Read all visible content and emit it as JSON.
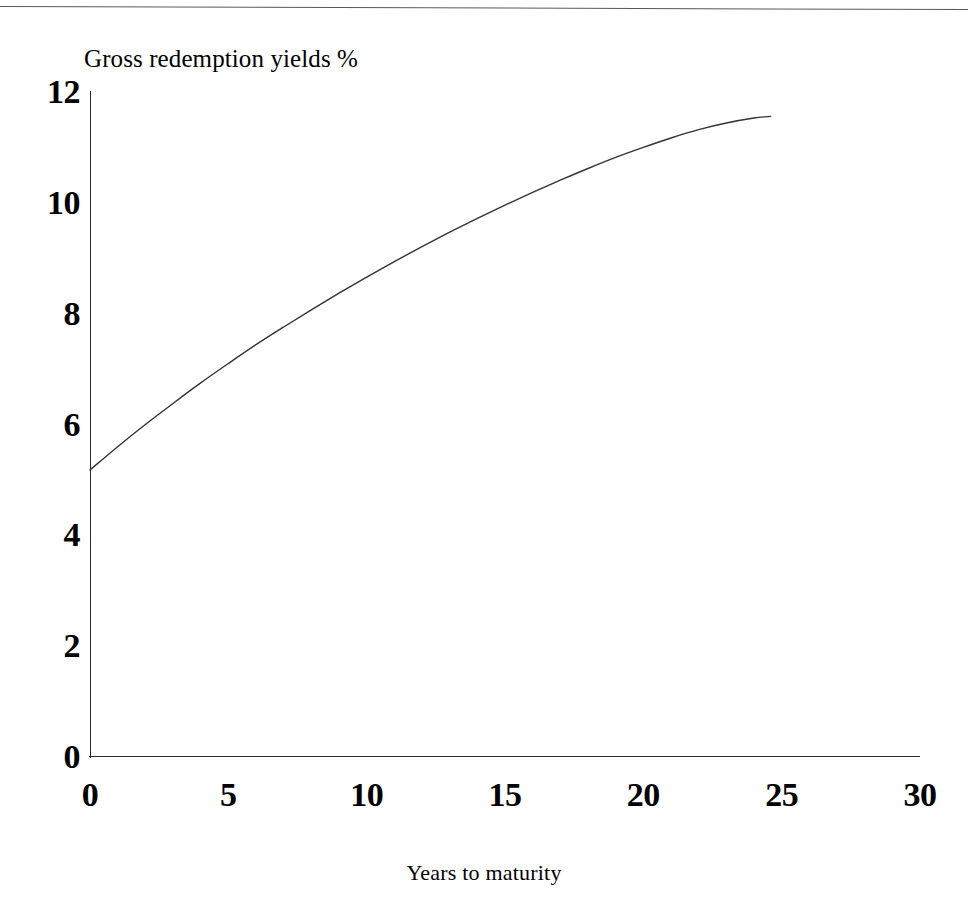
{
  "figure": {
    "background_color": "#ffffff",
    "ink_color": "#000000",
    "rule_color": "#555a5e",
    "has_top_rule": true
  },
  "chart_data": {
    "type": "line",
    "title": "",
    "subtitle": "",
    "ylabel": "Gross redemption yields %",
    "xlabel": "Years to maturity",
    "xlim": [
      0,
      30
    ],
    "ylim": [
      0,
      12
    ],
    "xticks": [
      0,
      5,
      10,
      15,
      20,
      25,
      30
    ],
    "yticks": [
      0,
      2,
      4,
      6,
      8,
      10,
      12
    ],
    "xtick_labels": [
      "0",
      "5",
      "10",
      "15",
      "20",
      "25",
      "30"
    ],
    "ytick_labels": [
      "0",
      "2",
      "4",
      "6",
      "8",
      "10",
      "12"
    ],
    "grid": false,
    "legend": false,
    "legend_position": "none",
    "tick_marks": false,
    "line_color": "#333333",
    "line_width": 1.4,
    "series": [
      {
        "name": "Gross redemption yield curve",
        "x": [
          0,
          1,
          2,
          3,
          4,
          5,
          6,
          7,
          8,
          9,
          10,
          11,
          12,
          13,
          14,
          15,
          16,
          17,
          18,
          19,
          20,
          21,
          22,
          23,
          24,
          24.6
        ],
        "values": [
          5.18,
          5.6,
          6.0,
          6.38,
          6.75,
          7.1,
          7.44,
          7.76,
          8.07,
          8.37,
          8.66,
          8.94,
          9.21,
          9.47,
          9.72,
          9.96,
          10.19,
          10.41,
          10.62,
          10.82,
          11.0,
          11.17,
          11.32,
          11.44,
          11.53,
          11.56
        ]
      }
    ],
    "annotations": []
  }
}
